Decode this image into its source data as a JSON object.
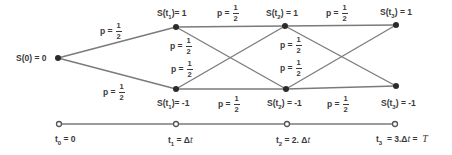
{
  "diagram": {
    "type": "binomial-tree",
    "colors": {
      "line": "#7a7a7a",
      "node": "#2b2b2b",
      "text": "#3a3a3a"
    },
    "nodes": {
      "s0": {
        "label": "S(0) = 0"
      },
      "s1_up": {
        "label_pre": "S(t",
        "sub": "1",
        "label_post": ")= 1"
      },
      "s1_down": {
        "label_pre": "S(t",
        "sub": "1",
        "label_post": ")= -1"
      },
      "s2_up": {
        "label_pre": "S(t",
        "sub": "2",
        "label_post": ") = 1"
      },
      "s2_down": {
        "label_pre": "S(t",
        "sub": "2",
        "label_post": ") = -1"
      },
      "s3_up": {
        "label_pre": "S(t",
        "sub": "3",
        "label_post": ") = 1"
      },
      "s3_down": {
        "label_pre": "S(t",
        "sub": "3",
        "label_post": ") = -1"
      }
    },
    "probability": {
      "prefix": "p =",
      "numerator": "1",
      "denominator": "2"
    },
    "timeline": {
      "t0": {
        "pre": "t",
        "sub": "0",
        "post": " = 0"
      },
      "t1": {
        "pre": "t",
        "sub": "1",
        "post": " = Δ",
        "var": "t"
      },
      "t2": {
        "pre": "t",
        "sub": "2",
        "post": " = 2. Δ",
        "var": "t"
      },
      "t3": {
        "pre": "t",
        "sub": "3",
        "post": "  = 3.Δ",
        "var": "t",
        "post2": " =  ",
        "var2": "T"
      }
    }
  }
}
